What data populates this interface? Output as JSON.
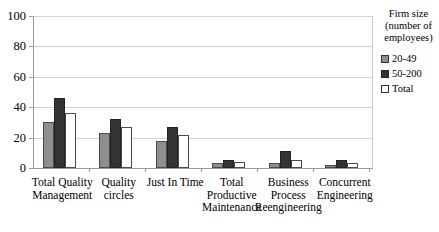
{
  "chart_data": {
    "type": "bar",
    "title": "",
    "subtitle": "",
    "xlabel": "",
    "ylabel": "",
    "ylim": [
      0,
      100
    ],
    "yticks": [
      0,
      20,
      40,
      60,
      80,
      100
    ],
    "grid": true,
    "legend_position": "right",
    "legend_title": "Firm size\n(number of\nemployees)",
    "categories": [
      "Total Quality\nManagement",
      "Quality\ncircles",
      "Just In Time",
      "Total\nProductive\nMaintenance",
      "Business\nProcess\nReengineering",
      "Concurrent\nEngineering"
    ],
    "series": [
      {
        "name": "20-49",
        "color": "#8e8e8e",
        "values": [
          30,
          23,
          18,
          3,
          3,
          2
        ]
      },
      {
        "name": "50-200",
        "color": "#333333",
        "values": [
          46,
          32,
          27,
          5,
          11,
          5
        ]
      },
      {
        "name": "Total",
        "color": "#ffffff",
        "values": [
          36,
          27,
          22,
          4,
          5,
          3
        ]
      }
    ]
  },
  "axis": {
    "y_tick_labels": [
      "100",
      "80",
      "60",
      "40",
      "20",
      "0"
    ]
  },
  "legend": {
    "title": "Firm size\n(number of\nemployees)",
    "entries": [
      {
        "label": "20-49"
      },
      {
        "label": "50-200"
      },
      {
        "label": "Total"
      }
    ]
  }
}
